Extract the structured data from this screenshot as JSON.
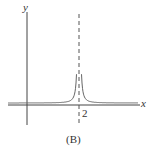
{
  "chart_data": {
    "type": "line",
    "title": "",
    "caption": "(B)",
    "xlabel": "x",
    "ylabel": "y",
    "x_ticks": [
      "2"
    ],
    "asymptote": {
      "type": "vertical",
      "x": 2,
      "style": "dashed"
    },
    "function_shape": "y = c/(x-2)^2, positive on both sides, approaching x-axis as |x| grows",
    "series": [
      {
        "name": "curve",
        "color": "#555555"
      }
    ],
    "grid": false,
    "legend": null
  },
  "labels": {
    "x": "x",
    "y": "y",
    "tick": "2",
    "caption": "(B)"
  }
}
